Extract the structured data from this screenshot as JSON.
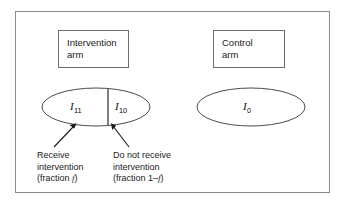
{
  "figure": {
    "background_color": "#ffffff",
    "frame_color": "#8a8a8a"
  },
  "arms": {
    "intervention": {
      "label_line1": "Intervention",
      "label_line2": "arm",
      "group_label_treated": "I",
      "group_label_treated_sub": "11",
      "group_label_untreated": "I",
      "group_label_untreated_sub": "10"
    },
    "control": {
      "label_line1": "Control",
      "label_line2": "arm",
      "group_label": "I",
      "group_label_sub": "0"
    }
  },
  "annotations": {
    "left": {
      "line1": "Receive",
      "line2": "intervention",
      "line3_prefix": "(fraction ",
      "line3_symbol": "f",
      "line3_suffix": ")"
    },
    "right": {
      "line1": "Do not receive",
      "line2": "intervention",
      "line3_prefix": "(fraction 1–",
      "line3_symbol": "f",
      "line3_suffix": ")"
    }
  }
}
